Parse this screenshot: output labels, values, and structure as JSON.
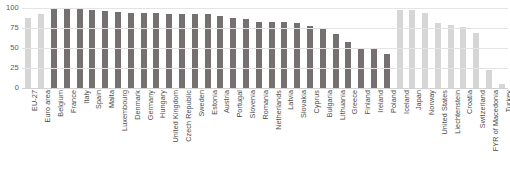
{
  "chart_data": {
    "type": "bar",
    "title": "",
    "subtitle": "",
    "xlabel": "",
    "ylabel": "",
    "ylim": [
      0,
      100
    ],
    "yticks": [
      0,
      25,
      50,
      75,
      100
    ],
    "grid": true,
    "legend": "none",
    "colors": {
      "eu_member": "#767171",
      "aggregate_or_non_eu": "#d6d6d6",
      "gridline": "#e4e4e4",
      "axis_text": "#5a5a5a",
      "category_text": "#4a4a4a",
      "background": "#ffffff"
    },
    "categories": [
      "EU-27",
      "Euro area",
      "Belgium",
      "France",
      "Italy",
      "Spain",
      "Malta",
      "Luxembourg",
      "Denmark",
      "Germany",
      "Hungary",
      "United Kingdom",
      "Czech Republic",
      "Sweden",
      "Estonia",
      "Austria",
      "Portugal",
      "Slovenia",
      "Romania",
      "Netherlands",
      "Latvia",
      "Slovakia",
      "Cyprus",
      "Bulgaria",
      "Lithuania",
      "Greece",
      "Finland",
      "Ireland",
      "Poland",
      "Iceland",
      "Japan",
      "Norway",
      "United States",
      "Liechtenstein",
      "Croatia",
      "Switzerland",
      "FYR of Macedonia",
      "Turkey"
    ],
    "values": [
      87,
      92,
      100,
      100,
      100,
      97,
      96,
      95,
      94,
      94,
      94,
      93,
      92,
      92,
      92,
      90,
      88,
      86,
      83,
      82,
      82,
      81,
      78,
      75,
      68,
      58,
      50,
      49,
      43,
      97,
      97,
      94,
      81,
      79,
      76,
      69,
      22,
      5
    ],
    "series_shades": [
      "light",
      "light",
      "dark",
      "dark",
      "dark",
      "dark",
      "dark",
      "dark",
      "dark",
      "dark",
      "dark",
      "dark",
      "dark",
      "dark",
      "dark",
      "dark",
      "dark",
      "dark",
      "dark",
      "dark",
      "dark",
      "dark",
      "dark",
      "dark",
      "dark",
      "dark",
      "dark",
      "dark",
      "dark",
      "light",
      "light",
      "light",
      "light",
      "light",
      "light",
      "light",
      "light",
      "light"
    ]
  }
}
